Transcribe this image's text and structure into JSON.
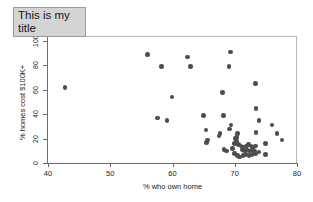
{
  "title": {
    "text": "This is my title",
    "background": "#d4d4d4",
    "border": "#9a9a9a"
  },
  "chart_data": {
    "type": "scatter",
    "title": "This is my title",
    "xlabel": "% who own home",
    "ylabel": "% homes cost $100K+",
    "xlim": [
      38.5,
      79.5
    ],
    "ylim": [
      -2,
      104
    ],
    "xticks": [
      40,
      50,
      60,
      70,
      80
    ],
    "yticks": [
      0,
      20,
      40,
      60,
      80,
      100
    ],
    "grid": false,
    "legend": null,
    "marker": {
      "shape": "circle",
      "color": "#4d4d4d",
      "size": 4.6
    },
    "points": [
      {
        "x": 42.7,
        "y": 62
      },
      {
        "x": 56.0,
        "y": 89
      },
      {
        "x": 58.2,
        "y": 79
      },
      {
        "x": 62.4,
        "y": 87
      },
      {
        "x": 62.9,
        "y": 79
      },
      {
        "x": 69.3,
        "y": 91
      },
      {
        "x": 69.1,
        "y": 79
      },
      {
        "x": 73.3,
        "y": 65
      },
      {
        "x": 68.0,
        "y": 58
      },
      {
        "x": 59.9,
        "y": 54
      },
      {
        "x": 73.4,
        "y": 44.5
      },
      {
        "x": 57.6,
        "y": 37
      },
      {
        "x": 59.1,
        "y": 35
      },
      {
        "x": 65.0,
        "y": 39
      },
      {
        "x": 68.2,
        "y": 39
      },
      {
        "x": 69.4,
        "y": 31
      },
      {
        "x": 69.2,
        "y": 28
      },
      {
        "x": 65.4,
        "y": 27
      },
      {
        "x": 67.6,
        "y": 24
      },
      {
        "x": 67.5,
        "y": 22
      },
      {
        "x": 65.6,
        "y": 19
      },
      {
        "x": 65.5,
        "y": 17
      },
      {
        "x": 70.4,
        "y": 24
      },
      {
        "x": 70.3,
        "y": 21
      },
      {
        "x": 70.3,
        "y": 18
      },
      {
        "x": 73.9,
        "y": 35
      },
      {
        "x": 76.0,
        "y": 31
      },
      {
        "x": 73.4,
        "y": 25
      },
      {
        "x": 76.8,
        "y": 24
      },
      {
        "x": 77.6,
        "y": 19
      },
      {
        "x": 74.9,
        "y": 16
      },
      {
        "x": 68.3,
        "y": 11
      },
      {
        "x": 68.7,
        "y": 10
      },
      {
        "x": 70.6,
        "y": 15
      },
      {
        "x": 71.0,
        "y": 14
      },
      {
        "x": 71.4,
        "y": 13
      },
      {
        "x": 71.8,
        "y": 14
      },
      {
        "x": 72.2,
        "y": 15
      },
      {
        "x": 72.6,
        "y": 14
      },
      {
        "x": 73.0,
        "y": 13
      },
      {
        "x": 73.3,
        "y": 14
      },
      {
        "x": 71.2,
        "y": 11
      },
      {
        "x": 71.6,
        "y": 10
      },
      {
        "x": 72.0,
        "y": 11
      },
      {
        "x": 72.4,
        "y": 10
      },
      {
        "x": 72.8,
        "y": 11
      },
      {
        "x": 73.2,
        "y": 10
      },
      {
        "x": 70.0,
        "y": 8
      },
      {
        "x": 70.4,
        "y": 6
      },
      {
        "x": 70.8,
        "y": 5
      },
      {
        "x": 71.3,
        "y": 6
      },
      {
        "x": 71.8,
        "y": 7
      },
      {
        "x": 72.3,
        "y": 6
      },
      {
        "x": 72.8,
        "y": 7
      },
      {
        "x": 73.3,
        "y": 8
      },
      {
        "x": 73.9,
        "y": 9
      },
      {
        "x": 74.9,
        "y": 7
      },
      {
        "x": 69.6,
        "y": 12
      },
      {
        "x": 70.0,
        "y": 16
      },
      {
        "x": 70.1,
        "y": 20
      }
    ]
  }
}
